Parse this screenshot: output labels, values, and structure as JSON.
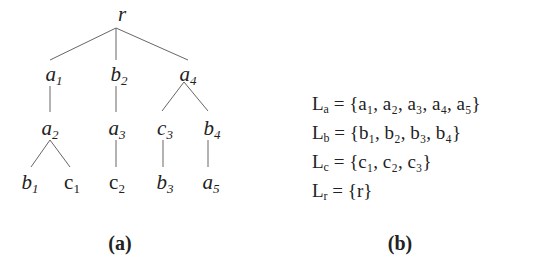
{
  "tree": {
    "root": "r",
    "nodes": [
      {
        "id": "r",
        "letter": "r",
        "sub": "",
        "x": 122,
        "y": 4
      },
      {
        "id": "a1",
        "letter": "a",
        "sub": "1",
        "x": 54,
        "y": 64
      },
      {
        "id": "b2",
        "letter": "b",
        "sub": "2",
        "x": 119,
        "y": 64
      },
      {
        "id": "a4",
        "letter": "a",
        "sub": "4",
        "x": 188,
        "y": 64
      },
      {
        "id": "a2",
        "letter": "a",
        "sub": "2",
        "x": 50,
        "y": 118
      },
      {
        "id": "a3",
        "letter": "a",
        "sub": "3",
        "x": 117,
        "y": 118
      },
      {
        "id": "c3",
        "letter": "c",
        "sub": "3",
        "x": 165,
        "y": 118
      },
      {
        "id": "b4",
        "letter": "b",
        "sub": "4",
        "x": 212,
        "y": 118
      },
      {
        "id": "b1",
        "letter": "b",
        "sub": "1",
        "x": 30,
        "y": 172
      },
      {
        "id": "c1",
        "letter": "c",
        "sub": "1",
        "x": 72,
        "y": 172,
        "upright": true
      },
      {
        "id": "c2",
        "letter": "c",
        "sub": "2",
        "x": 117,
        "y": 172,
        "upright": true
      },
      {
        "id": "b3",
        "letter": "b",
        "sub": "3",
        "x": 165,
        "y": 172
      },
      {
        "id": "a5",
        "letter": "a",
        "sub": "5",
        "x": 211,
        "y": 172
      }
    ],
    "edges": [
      [
        116,
        28,
        50,
        60
      ],
      [
        116,
        28,
        116,
        60
      ],
      [
        116,
        28,
        188,
        60
      ],
      [
        50,
        86,
        50,
        112
      ],
      [
        116,
        86,
        116,
        112
      ],
      [
        184,
        82,
        162,
        111
      ],
      [
        184,
        82,
        208,
        111
      ],
      [
        50,
        140,
        31,
        167
      ],
      [
        50,
        140,
        70,
        167
      ],
      [
        116,
        140,
        116,
        167
      ],
      [
        163,
        140,
        163,
        167
      ],
      [
        208,
        140,
        208,
        167
      ]
    ]
  },
  "captions": {
    "a": "(a)",
    "b": "(b)"
  },
  "label_sets": [
    {
      "name": "L",
      "sub": "a",
      "members": "{a₁, a₂, a₃, a₄, a₅}"
    },
    {
      "name": "L",
      "sub": "b",
      "members": "{b₁, b₂, b₃, b₄}"
    },
    {
      "name": "L",
      "sub": "c",
      "members": "{c₁, c₂, c₃}"
    },
    {
      "name": "L",
      "sub": "r",
      "members": "{r}"
    }
  ]
}
